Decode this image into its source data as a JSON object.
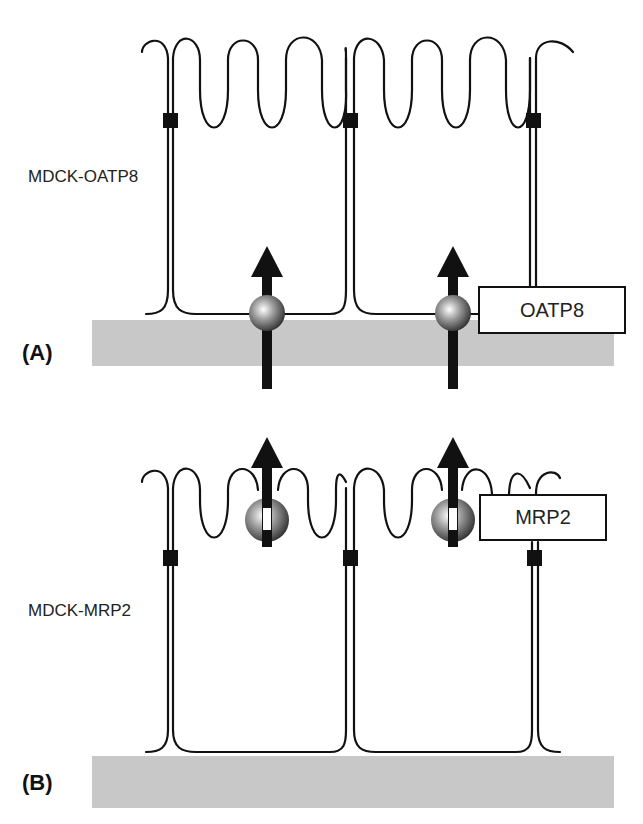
{
  "panels": [
    {
      "id": "A",
      "panel_label": "(A)",
      "cell_line_label": "MDCK-OATP8",
      "transporter_label": "OATP8",
      "transporter_location": "basolateral",
      "arrows": 2
    },
    {
      "id": "B",
      "panel_label": "(B)",
      "cell_line_label": "MDCK-MRP2",
      "transporter_label": "MRP2",
      "transporter_location": "apical",
      "arrows": 2
    }
  ],
  "colors": {
    "line": "#111111",
    "support": "#c8c8c8",
    "sphere_light": "#ffffff",
    "sphere_dark": "#3a3a3a"
  }
}
